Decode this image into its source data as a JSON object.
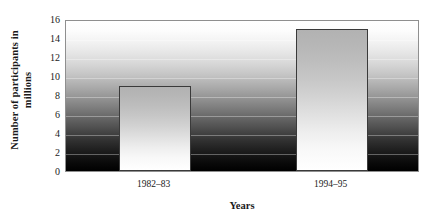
{
  "chart_data": {
    "type": "bar",
    "title": "",
    "categories": [
      "1982–83",
      "1994–95"
    ],
    "values": [
      9,
      15
    ],
    "series": [
      {
        "name": "Number of participants",
        "values": [
          9,
          15
        ]
      }
    ],
    "xlabel": "Years",
    "ylabel_line1": "Number of participants in",
    "ylabel_line2": "millions",
    "ylabel": "Number of participants in millions",
    "ylim": [
      0,
      16
    ],
    "ytick_step": 2,
    "yticks": [
      "16",
      "14",
      "12",
      "10",
      "8",
      "6",
      "4",
      "2",
      "0"
    ],
    "ytick_values": [
      16,
      14,
      12,
      10,
      8,
      6,
      4,
      2,
      0
    ],
    "grid": true,
    "legend": "none",
    "colors": {
      "bar_top": "#b2b2b2",
      "bar_bottom": "#ffffff",
      "bar_outline": "#3a3a3a",
      "plot_bg_top": "#ffffff",
      "plot_bg_bottom": "#000000",
      "frame": "#8f8f8f",
      "text": "#1a1a1a"
    }
  }
}
